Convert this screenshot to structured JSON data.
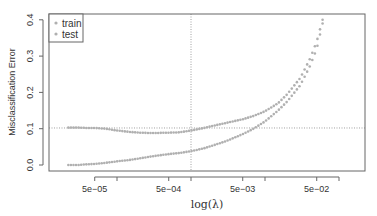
{
  "chart_data": {
    "type": "scatter",
    "title": "",
    "xlabel": "log(λ)",
    "ylabel": "Misclassification Error",
    "xscale": "log10",
    "xlim": [
      1.2e-05,
      0.3
    ],
    "ylim": [
      -0.01,
      0.41
    ],
    "y_ticks": [
      0.0,
      0.1,
      0.2,
      0.3,
      0.4
    ],
    "y_tick_labels": [
      "0.0",
      "0.1",
      "0.2",
      "0.3",
      "0.4"
    ],
    "x_ticks": [
      5e-05,
      0.0001,
      0.0005,
      0.001,
      0.005,
      0.01,
      0.05,
      0.1
    ],
    "x_tick_labels": [
      "5e−05",
      "",
      "5e−04",
      "",
      "5e−03",
      "",
      "5e−02",
      ""
    ],
    "grid": false,
    "legend_position": "top-left",
    "reference_lines": {
      "vertical_x": 0.001,
      "horizontal_y": 0.102
    },
    "series": [
      {
        "name": "train",
        "color": "#b0b0b0",
        "x": [
          2.2e-05,
          3e-05,
          4e-05,
          5e-05,
          7e-05,
          0.0001,
          0.00015,
          0.0002,
          0.0003,
          0.0005,
          0.0007,
          0.001,
          0.0015,
          0.002,
          0.003,
          0.005,
          0.007,
          0.01,
          0.015,
          0.02,
          0.03,
          0.04,
          0.05,
          0.06
        ],
        "values": [
          0.0,
          0.0,
          0.002,
          0.003,
          0.006,
          0.01,
          0.014,
          0.018,
          0.024,
          0.03,
          0.033,
          0.038,
          0.046,
          0.054,
          0.066,
          0.085,
          0.1,
          0.12,
          0.15,
          0.175,
          0.22,
          0.27,
          0.32,
          0.39
        ]
      },
      {
        "name": "test",
        "color": "#b0b0b0",
        "x": [
          2.2e-05,
          3e-05,
          4e-05,
          5e-05,
          7e-05,
          0.0001,
          0.00015,
          0.0002,
          0.0003,
          0.0005,
          0.0007,
          0.001,
          0.0015,
          0.002,
          0.003,
          0.005,
          0.007,
          0.01,
          0.015,
          0.02,
          0.03,
          0.04,
          0.05,
          0.06
        ],
        "values": [
          0.103,
          0.103,
          0.102,
          0.102,
          0.1,
          0.095,
          0.091,
          0.089,
          0.088,
          0.089,
          0.09,
          0.095,
          0.102,
          0.108,
          0.116,
          0.126,
          0.135,
          0.148,
          0.17,
          0.195,
          0.24,
          0.29,
          0.34,
          0.4
        ]
      }
    ]
  },
  "legend": {
    "items": [
      {
        "label": "train"
      },
      {
        "label": "test"
      }
    ]
  },
  "axes": {
    "ylabel": "Misclassification Error",
    "xlabel": "log(λ)"
  }
}
